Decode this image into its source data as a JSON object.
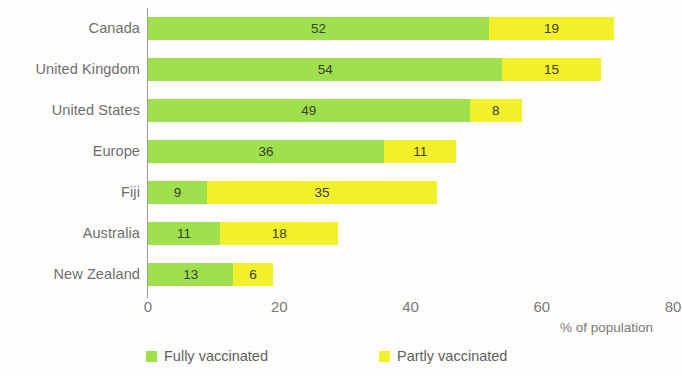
{
  "chart_data": {
    "type": "bar",
    "orientation": "horizontal",
    "stacked": true,
    "title": "",
    "xlabel": "% of population",
    "ylabel": "",
    "xlim": [
      0,
      80
    ],
    "xticks": [
      0,
      20,
      40,
      60,
      80
    ],
    "xtick_labels": [
      "0",
      "20",
      "40",
      "60",
      "80"
    ],
    "grid": false,
    "legend_position": "bottom",
    "categories": [
      "Canada",
      "United Kingdom",
      "United States",
      "Europe",
      "Fiji",
      "Australia",
      "New Zealand"
    ],
    "series": [
      {
        "name": "Fully vaccinated",
        "color": "#9ee04d",
        "values": [
          52,
          54,
          49,
          36,
          9,
          11,
          13
        ]
      },
      {
        "name": "Partly vaccinated",
        "color": "#f2f02b",
        "values": [
          19,
          15,
          8,
          11,
          35,
          18,
          6
        ]
      }
    ],
    "totals": [
      71,
      69,
      57,
      47,
      44,
      29,
      19
    ]
  },
  "legend": {
    "items": [
      {
        "label": "Fully vaccinated",
        "color": "#9ee04d"
      },
      {
        "label": "Partly vaccinated",
        "color": "#f2f02b"
      }
    ]
  },
  "axis": {
    "x_title": "% of population"
  },
  "colors": {
    "fully_vaccinated": "#9ee04d",
    "partly_vaccinated": "#f2f02b",
    "axis_line": "#9b9b9b",
    "label_text": "#6e6e6e",
    "value_text": "#3d3d2a",
    "background": "#fdfdfb"
  }
}
